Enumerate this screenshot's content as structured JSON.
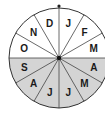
{
  "diagram": {
    "type": "month-wheel",
    "segments": [
      {
        "label": "J",
        "month": "January",
        "half": "upper"
      },
      {
        "label": "F",
        "month": "February",
        "half": "upper"
      },
      {
        "label": "M",
        "month": "March",
        "half": "upper"
      },
      {
        "label": "A",
        "month": "April",
        "half": "lower"
      },
      {
        "label": "M",
        "month": "May",
        "half": "lower"
      },
      {
        "label": "J",
        "month": "June",
        "half": "lower"
      },
      {
        "label": "J",
        "month": "July",
        "half": "lower"
      },
      {
        "label": "A",
        "month": "August",
        "half": "lower"
      },
      {
        "label": "S",
        "month": "September",
        "half": "lower"
      },
      {
        "label": "O",
        "month": "October",
        "half": "upper"
      },
      {
        "label": "N",
        "month": "November",
        "half": "upper"
      },
      {
        "label": "D",
        "month": "December",
        "half": "upper"
      }
    ],
    "colors": {
      "upper_fill": "#ffffff",
      "lower_fill": "#d4d4d4",
      "stroke": "#333333"
    }
  }
}
